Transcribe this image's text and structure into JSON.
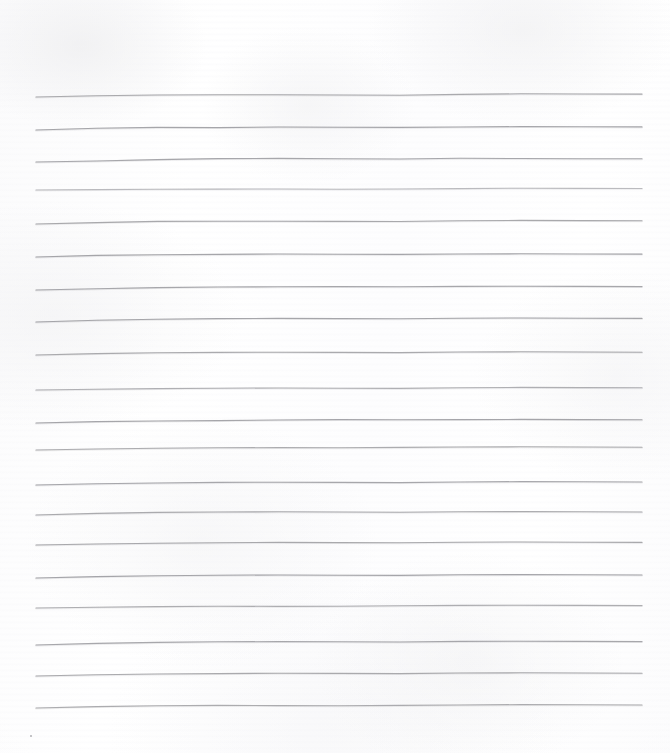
{
  "document": {
    "kind": "scanned-lined-paper",
    "title": "Blank ruled notebook page",
    "orientation": "portrait",
    "width_px": 670,
    "height_px": 753,
    "written_content": "",
    "colors": {
      "paper_background": "#fdfdfd",
      "paper_highlight": "#ffffff",
      "paper_shade": "#f2f2f4",
      "rule_line": "#9a9a9e",
      "rule_line_light": "#b4b4b8",
      "speck": "#b0b0b4"
    }
  },
  "ruling": {
    "label": "Horizontal ruled lines",
    "line_count": 20,
    "first_line_y": 97,
    "last_line_y": 708,
    "line_spacing_px": 32.2,
    "line_start_x": 36,
    "line_end_x": 642,
    "line_width_px": 606,
    "stroke_width_px": 1.1,
    "margin_left_px": 36,
    "margin_right_px": 28,
    "margin_top_px": 97,
    "margin_bottom_px": 45,
    "lines": [
      {
        "index": 1,
        "y": 97,
        "opacity": 0.8,
        "wave": [
          0,
          -1.2,
          -2.0,
          -2.3,
          -2.2,
          -2.0,
          -1.8,
          -2.6,
          -3.2,
          -3.0,
          -2.9
        ]
      },
      {
        "index": 2,
        "y": 130,
        "opacity": 0.86,
        "wave": [
          0,
          -1.8,
          -2.6,
          -2.4,
          -3.0,
          -2.8,
          -2.6,
          -3.0,
          -3.4,
          -3.2,
          -3.1
        ]
      },
      {
        "index": 3,
        "y": 162,
        "opacity": 0.84,
        "wave": [
          0,
          -1.0,
          -2.4,
          -3.4,
          -3.6,
          -3.3,
          -3.0,
          -3.8,
          -3.5,
          -3.3,
          -3.2
        ]
      },
      {
        "index": 4,
        "y": 190,
        "opacity": 0.62,
        "wave": [
          0,
          -0.4,
          -0.8,
          -0.9,
          -1.0,
          -0.8,
          -1.0,
          -1.4,
          -1.8,
          -1.6,
          -1.5
        ]
      },
      {
        "index": 5,
        "y": 224,
        "opacity": 0.82,
        "wave": [
          0,
          -1.4,
          -2.6,
          -2.8,
          -2.7,
          -2.6,
          -2.5,
          -3.2,
          -3.6,
          -3.4,
          -3.3
        ]
      },
      {
        "index": 6,
        "y": 257,
        "opacity": 0.86,
        "wave": [
          0,
          -1.6,
          -2.2,
          -2.6,
          -3.0,
          -2.8,
          -2.6,
          -3.0,
          -3.2,
          -3.0,
          -2.9
        ]
      },
      {
        "index": 7,
        "y": 290,
        "opacity": 0.84,
        "wave": [
          0,
          -1.2,
          -2.4,
          -3.0,
          -3.2,
          -3.4,
          -3.2,
          -3.6,
          -3.8,
          -3.6,
          -3.4
        ]
      },
      {
        "index": 8,
        "y": 322,
        "opacity": 0.86,
        "wave": [
          0,
          -1.8,
          -2.8,
          -3.4,
          -3.6,
          -3.4,
          -3.2,
          -3.8,
          -4.0,
          -3.8,
          -3.6
        ]
      },
      {
        "index": 9,
        "y": 355,
        "opacity": 0.8,
        "wave": [
          0,
          -1.4,
          -2.2,
          -2.6,
          -2.8,
          -2.6,
          -2.4,
          -3.0,
          -3.2,
          -3.0,
          -2.8
        ]
      },
      {
        "index": 10,
        "y": 390,
        "opacity": 0.74,
        "wave": [
          0,
          -0.8,
          -1.4,
          -1.8,
          -2.0,
          -1.8,
          -1.6,
          -2.2,
          -2.6,
          -2.4,
          -2.2
        ]
      },
      {
        "index": 11,
        "y": 423,
        "opacity": 0.86,
        "wave": [
          0,
          -1.4,
          -2.0,
          -2.4,
          -3.0,
          -3.4,
          -3.2,
          -3.4,
          -3.6,
          -3.4,
          -3.2
        ]
      },
      {
        "index": 12,
        "y": 450,
        "opacity": 0.78,
        "wave": [
          0,
          -1.0,
          -1.8,
          -2.2,
          -2.4,
          -2.2,
          -2.6,
          -3.0,
          -3.2,
          -3.0,
          -2.8
        ]
      },
      {
        "index": 13,
        "y": 485,
        "opacity": 0.84,
        "wave": [
          0,
          -1.2,
          -2.0,
          -2.6,
          -2.8,
          -2.6,
          -2.4,
          -3.0,
          -3.4,
          -3.2,
          -3.0
        ]
      },
      {
        "index": 14,
        "y": 515,
        "opacity": 0.8,
        "wave": [
          0,
          -1.6,
          -2.6,
          -3.0,
          -3.2,
          -3.0,
          -2.8,
          -3.2,
          -3.4,
          -3.2,
          -3.0
        ]
      },
      {
        "index": 15,
        "y": 545,
        "opacity": 0.82,
        "wave": [
          0,
          -1.0,
          -1.8,
          -2.2,
          -2.6,
          -2.4,
          -2.2,
          -2.8,
          -3.0,
          -2.8,
          -2.6
        ]
      },
      {
        "index": 16,
        "y": 578,
        "opacity": 0.86,
        "wave": [
          0,
          -1.4,
          -2.2,
          -2.8,
          -3.0,
          -2.8,
          -2.6,
          -3.2,
          -3.4,
          -3.2,
          -3.0
        ]
      },
      {
        "index": 17,
        "y": 608,
        "opacity": 0.76,
        "wave": [
          0,
          -0.8,
          -1.4,
          -1.8,
          -1.6,
          -1.8,
          -2.2,
          -2.6,
          -2.8,
          -2.6,
          -2.4
        ]
      },
      {
        "index": 18,
        "y": 645,
        "opacity": 0.84,
        "wave": [
          0,
          -1.6,
          -2.6,
          -3.2,
          -3.4,
          -3.2,
          -3.0,
          -3.6,
          -3.8,
          -3.6,
          -3.4
        ]
      },
      {
        "index": 19,
        "y": 676,
        "opacity": 0.8,
        "wave": [
          0,
          -1.2,
          -2.0,
          -2.4,
          -2.8,
          -2.6,
          -2.4,
          -3.0,
          -3.2,
          -3.0,
          -2.8
        ]
      },
      {
        "index": 20,
        "y": 708,
        "opacity": 0.78,
        "wave": [
          0,
          -1.4,
          -2.2,
          -2.6,
          -2.4,
          -2.2,
          -2.6,
          -3.0,
          -3.4,
          -3.2,
          -3.0
        ]
      }
    ]
  },
  "artifacts": {
    "speck": {
      "label": "dust speck",
      "x": 30,
      "y": 735
    }
  }
}
